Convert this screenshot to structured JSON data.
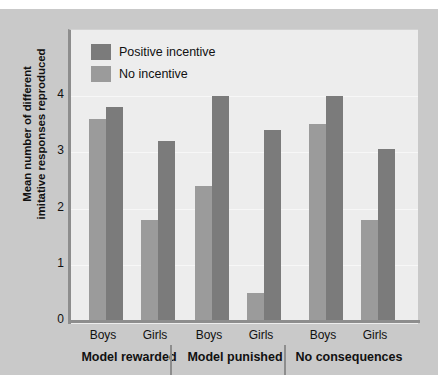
{
  "chart_data": {
    "type": "bar",
    "title": "",
    "subtitle": "",
    "xlabel": "",
    "ylabel": "Mean number of different imitative responses reproduced",
    "ylabel_lines": [
      "Mean number of different",
      "imitative responses reproduced"
    ],
    "ylim": [
      0,
      4.6
    ],
    "yticks": [
      0,
      1,
      2,
      3,
      4
    ],
    "ytick_labels": [
      "0",
      "1",
      "2",
      "3",
      "4"
    ],
    "grid": true,
    "legend_position": "top-left",
    "categories": [
      "Boys",
      "Girls",
      "Boys",
      "Girls",
      "Boys",
      "Girls"
    ],
    "groups": [
      {
        "name": "Model rewarded",
        "subgroups": [
          {
            "label": "Boys",
            "no_incentive": 3.6,
            "positive_incentive": 3.8
          },
          {
            "label": "Girls",
            "no_incentive": 1.8,
            "positive_incentive": 3.2
          }
        ]
      },
      {
        "name": "Model punished",
        "subgroups": [
          {
            "label": "Boys",
            "no_incentive": 2.4,
            "positive_incentive": 4.0
          },
          {
            "label": "Girls",
            "no_incentive": 0.5,
            "positive_incentive": 3.4
          }
        ]
      },
      {
        "name": "No consequences",
        "subgroups": [
          {
            "label": "Boys",
            "no_incentive": 3.5,
            "positive_incentive": 4.0
          },
          {
            "label": "Girls",
            "no_incentive": 1.8,
            "positive_incentive": 3.05
          }
        ]
      }
    ],
    "series": [
      {
        "name": "No incentive",
        "color": "#9b9b9b",
        "values": [
          3.6,
          1.8,
          2.4,
          0.5,
          3.5,
          1.8
        ]
      },
      {
        "name": "Positive incentive",
        "color": "#7b7b7b",
        "values": [
          3.8,
          3.2,
          4.0,
          3.4,
          4.0,
          3.05
        ]
      }
    ]
  },
  "legend": {
    "items": [
      {
        "label": "Positive incentive",
        "color": "#7b7b7b"
      },
      {
        "label": "No incentive",
        "color": "#9b9b9b"
      }
    ]
  },
  "colors": {
    "positive_incentive": "#7b7b7b",
    "no_incentive": "#9b9b9b",
    "panel_background": "#ededed",
    "figure_background": "#c9c9c9",
    "axis": "#8d8d8d",
    "text": "#111111"
  }
}
